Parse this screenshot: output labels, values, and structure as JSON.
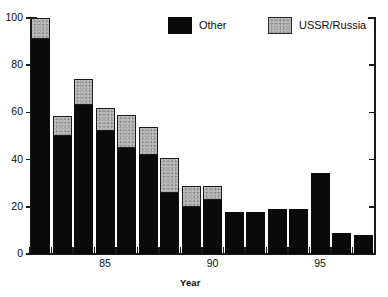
{
  "chart_data": {
    "type": "bar",
    "stacked": true,
    "title": "",
    "xlabel": "Year",
    "ylabel": "",
    "ylim": [
      0,
      100
    ],
    "yticks": [
      0,
      20,
      40,
      60,
      80,
      100
    ],
    "ytick_labels": [
      "0",
      "20",
      "40",
      "60",
      "80",
      "100"
    ],
    "grid": false,
    "legend_position": "top-center",
    "categories": [
      "1982",
      "1983",
      "1984",
      "1985",
      "1986",
      "1987",
      "1988",
      "1989",
      "1990",
      "1991",
      "1992",
      "1993",
      "1994",
      "1995",
      "1996",
      "1997"
    ],
    "xtick_labels": [
      "85",
      "90",
      "95"
    ],
    "xtick_categories": [
      "1985",
      "1990",
      "1995"
    ],
    "series": [
      {
        "name": "Other",
        "color": "#0a0a0a",
        "values": [
          91,
          50,
          63,
          52,
          45,
          42,
          26,
          20,
          23,
          18,
          18,
          19,
          19,
          34.5,
          9,
          8
        ]
      },
      {
        "name": "USSR/Russia",
        "color": "#a9a9a9",
        "values": [
          9,
          8.5,
          11,
          10,
          14,
          12,
          14.5,
          9,
          6,
          0,
          0,
          0,
          0,
          0,
          0,
          0
        ]
      }
    ],
    "totals": [
      100,
      58.5,
      74,
      62,
      59,
      54,
      40.5,
      29,
      29,
      18,
      18,
      19,
      19,
      34.5,
      9,
      8
    ]
  },
  "legend": {
    "entries": [
      {
        "label": "Other",
        "swatch": "black-square-swatch"
      },
      {
        "label": "USSR/Russia",
        "swatch": "stippled-gray-square-swatch"
      }
    ]
  },
  "axes": {
    "x_title": "Year"
  }
}
